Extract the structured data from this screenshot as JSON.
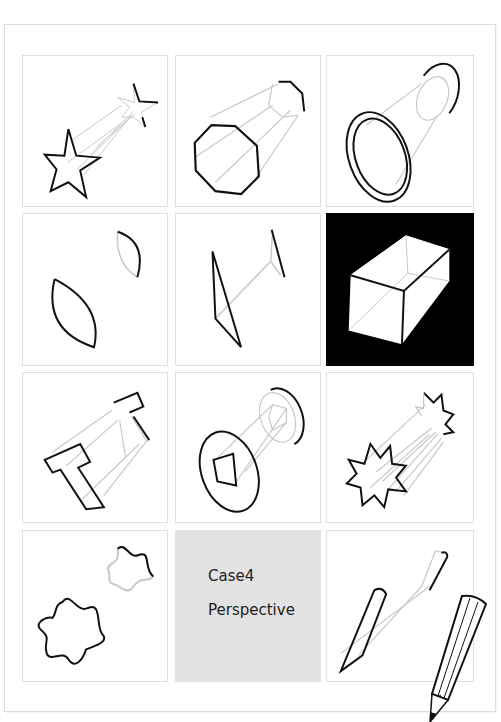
{
  "page": {
    "title_cell": {
      "line1": "Case4",
      "line2": "Perspective"
    }
  },
  "grid": {
    "rows": 4,
    "cols": 3,
    "cells": [
      {
        "row": 1,
        "col": 1,
        "shape": "star",
        "style": "outline"
      },
      {
        "row": 1,
        "col": 2,
        "shape": "octagon-prism",
        "style": "outline"
      },
      {
        "row": 1,
        "col": 3,
        "shape": "ring-cylinder",
        "style": "outline"
      },
      {
        "row": 2,
        "col": 1,
        "shape": "leaf",
        "style": "outline"
      },
      {
        "row": 2,
        "col": 2,
        "shape": "triangle-plane",
        "style": "outline"
      },
      {
        "row": 2,
        "col": 3,
        "shape": "rectangular-box",
        "style": "inverted"
      },
      {
        "row": 3,
        "col": 1,
        "shape": "t-beam",
        "style": "outline"
      },
      {
        "row": 3,
        "col": 2,
        "shape": "disc-with-square-rod",
        "style": "outline"
      },
      {
        "row": 3,
        "col": 3,
        "shape": "burst-star",
        "style": "outline"
      },
      {
        "row": 4,
        "col": 1,
        "shape": "wavy-flower",
        "style": "outline"
      },
      {
        "row": 4,
        "col": 2,
        "shape": "title-card",
        "style": "gray"
      },
      {
        "row": 4,
        "col": 3,
        "shape": "pencil",
        "style": "outline"
      }
    ]
  },
  "colors": {
    "stroke": "#111111",
    "guide": "#c8c8c8",
    "cell_border": "#dedede",
    "title_bg": "#e2e2e2",
    "dark_bg": "#000000"
  }
}
